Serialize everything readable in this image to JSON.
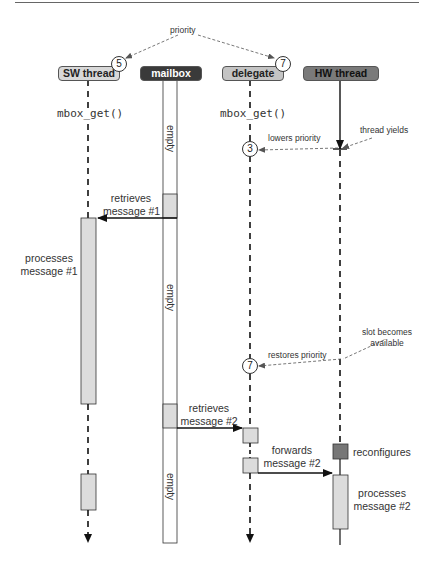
{
  "header": {
    "priority_label": "priority"
  },
  "lanes": [
    {
      "id": "sw",
      "label": "SW thread",
      "priority": "5"
    },
    {
      "id": "mailbox",
      "label": "mailbox"
    },
    {
      "id": "delegate",
      "label": "delegate",
      "priority": "7"
    },
    {
      "id": "hw",
      "label": "HW thread"
    }
  ],
  "calls": {
    "sw_call": "mbox_get()",
    "delegate_call": "mbox_get()"
  },
  "mailbox_slots": {
    "empty1": "empty",
    "empty2": "empty",
    "empty3": "empty"
  },
  "annotations": {
    "thread_yields": "thread yields",
    "lowers_priority": "lowers priority",
    "lowered_priority_value": "3",
    "retrieves_1_line1": "retrieves",
    "retrieves_1_line2": "message #1",
    "processes_1_line1": "processes",
    "processes_1_line2": "message #1",
    "slot_available_line1": "slot becomes",
    "slot_available_line2": "available",
    "restores_priority": "restores priority",
    "restored_priority_value": "7",
    "retrieves_2_line1": "retrieves",
    "retrieves_2_line2": "message #2",
    "forwards_2_line1": "forwards",
    "forwards_2_line2": "message #2",
    "reconfigures": "reconfigures",
    "processes_2_line1": "processes",
    "processes_2_line2": "message #2"
  },
  "colors": {
    "activation_fill": "#dcdcdc",
    "reconfigure_fill": "#777777",
    "mailbox_header": "#3a3a3a",
    "hw_header": "#7a7a7a",
    "line": "#111111",
    "dashed_annotation": "#555555"
  }
}
